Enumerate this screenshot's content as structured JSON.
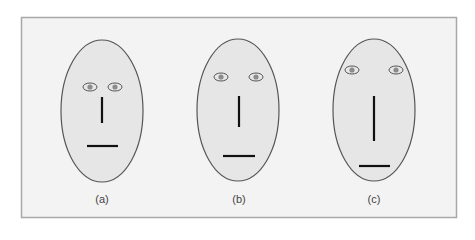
{
  "figure": {
    "frame": {
      "x": 21,
      "y": 17,
      "width": 435,
      "height": 200,
      "fill": "#f3f3f3",
      "stroke": "#a8a8a8"
    },
    "colors": {
      "face_fill": "#e6e6e6",
      "face_stroke": "#555555",
      "feature": "#111111",
      "eye_white": "#e8e8e8",
      "eye_iris": "#8c8c8c"
    },
    "faces": [
      {
        "label": "(a)",
        "cx": 102,
        "cy": 111,
        "rx": 41,
        "ry": 71,
        "eyes": [
          {
            "cx": 90,
            "cy": 87
          },
          {
            "cx": 115,
            "cy": 87
          }
        ],
        "nose": {
          "x": 102,
          "y1": 97,
          "y2": 123
        },
        "mouth": {
          "x1": 87,
          "x2": 118,
          "y": 146
        },
        "label_pos": {
          "x": 102,
          "y": 193
        }
      },
      {
        "label": "(b)",
        "cx": 238,
        "cy": 110,
        "rx": 41,
        "ry": 71,
        "eyes": [
          {
            "cx": 221,
            "cy": 77
          },
          {
            "cx": 256,
            "cy": 77
          }
        ],
        "nose": {
          "x": 239,
          "y1": 96,
          "y2": 127
        },
        "mouth": {
          "x1": 223,
          "x2": 255,
          "y": 156
        },
        "label_pos": {
          "x": 239,
          "y": 193
        }
      },
      {
        "label": "(c)",
        "cx": 374,
        "cy": 110,
        "rx": 41,
        "ry": 71,
        "eyes": [
          {
            "cx": 352,
            "cy": 70
          },
          {
            "cx": 396,
            "cy": 70
          }
        ],
        "nose": {
          "x": 374,
          "y1": 96,
          "y2": 141
        },
        "mouth": {
          "x1": 359,
          "x2": 390,
          "y": 166
        },
        "label_pos": {
          "x": 374,
          "y": 193
        }
      }
    ]
  }
}
